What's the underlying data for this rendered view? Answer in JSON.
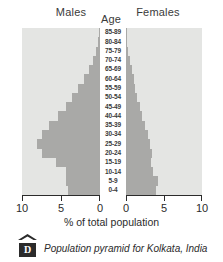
{
  "header": {
    "males_label": "Males",
    "age_label": "Age",
    "females_label": "Females"
  },
  "axis": {
    "title": "% of total population",
    "left_ticks": [
      "10",
      "5",
      "0"
    ],
    "right_ticks": [
      "0",
      "5",
      "10"
    ]
  },
  "caption": {
    "badge_letter": "D",
    "text": "Population pyramid for Kolkata, India"
  },
  "colors": {
    "plot_background": "#e4e5e3",
    "bar_fill": "#a9a9a7",
    "axis": "#2b2b2b",
    "page_background": "#ffffff"
  },
  "chart_data": {
    "type": "bar",
    "subtype": "population-pyramid",
    "title": "Population pyramid for Kolkata, India",
    "xlabel": "% of total population",
    "ylabel": "Age",
    "xlim": [
      0,
      10
    ],
    "axis_direction": "males extend left from center, females extend right from center",
    "grid": false,
    "legend": "none",
    "categories": [
      "0-4",
      "5-9",
      "10-14",
      "15-19",
      "20-24",
      "25-29",
      "30-34",
      "35-39",
      "40-44",
      "45-49",
      "50-54",
      "55-59",
      "60-64",
      "65-69",
      "70-74",
      "75-79",
      "80-84",
      "85-89"
    ],
    "series": [
      {
        "name": "Males",
        "side": "left",
        "values": [
          4.1,
          4.3,
          4.4,
          5.7,
          7.4,
          8.1,
          7.5,
          6.5,
          5.4,
          4.4,
          3.6,
          2.8,
          2.1,
          1.4,
          0.9,
          0.5,
          0.25,
          0.12
        ]
      },
      {
        "name": "Females",
        "side": "right",
        "values": [
          3.9,
          4.2,
          3.6,
          3.3,
          3.4,
          3.2,
          2.9,
          2.5,
          2.1,
          1.8,
          1.5,
          1.2,
          1.0,
          0.75,
          0.5,
          0.3,
          0.18,
          0.1
        ]
      }
    ]
  }
}
